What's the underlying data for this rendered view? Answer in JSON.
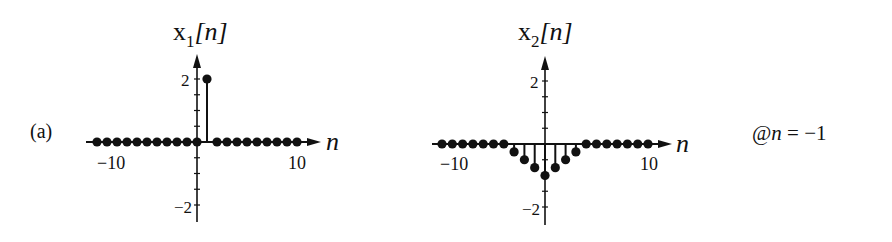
{
  "figure": {
    "panel_label": "(a)",
    "annotation": "@n = −1",
    "annotation_parts": {
      "at": "@",
      "var": "n",
      "rest": " = −1"
    }
  },
  "chart_data": [
    {
      "type": "stem",
      "title": "x1[n]",
      "title_parts": {
        "base": "x",
        "sub": "1",
        "arg": "[n]"
      },
      "xlabel": "n",
      "ylabel": "",
      "xlim": [
        -10,
        10
      ],
      "ylim": [
        -2,
        2
      ],
      "x_tick_labels": [
        "−10",
        "10"
      ],
      "y_tick_labels": [
        "2",
        "−2"
      ],
      "y_minor_tick_step": 0.5,
      "grid": false,
      "x": [
        -10,
        -9,
        -8,
        -7,
        -6,
        -5,
        -4,
        -3,
        -2,
        -1,
        0,
        1,
        2,
        3,
        4,
        5,
        6,
        7,
        8,
        9,
        10
      ],
      "values": [
        0,
        0,
        0,
        0,
        0,
        0,
        0,
        0,
        0,
        0,
        0,
        2,
        0,
        0,
        0,
        0,
        0,
        0,
        0,
        0,
        0
      ]
    },
    {
      "type": "stem",
      "title": "x2[n]",
      "title_parts": {
        "base": "x",
        "sub": "2",
        "arg": "[n]"
      },
      "xlabel": "n",
      "ylabel": "",
      "xlim": [
        -10,
        10
      ],
      "ylim": [
        -2,
        2
      ],
      "x_tick_labels": [
        "−10",
        "10"
      ],
      "y_tick_labels": [
        "2",
        "−2"
      ],
      "y_minor_tick_step": 0.5,
      "grid": false,
      "x": [
        -10,
        -9,
        -8,
        -7,
        -6,
        -5,
        -4,
        -3,
        -2,
        -1,
        0,
        1,
        2,
        3,
        4,
        5,
        6,
        7,
        8,
        9,
        10
      ],
      "values": [
        0,
        0,
        0,
        0,
        0,
        0,
        0,
        -0.25,
        -0.5,
        -0.75,
        -1,
        -0.75,
        -0.5,
        -0.25,
        0,
        0,
        0,
        0,
        0,
        0,
        0
      ]
    }
  ]
}
